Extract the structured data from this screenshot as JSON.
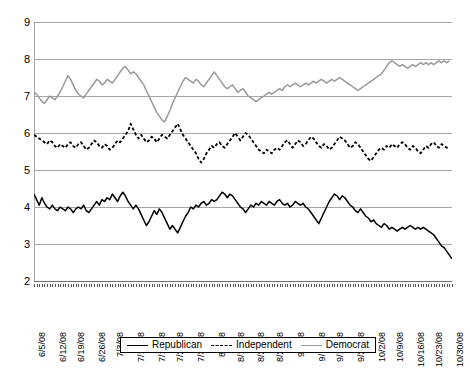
{
  "chart_data": {
    "type": "line",
    "title": "",
    "subtitle": "",
    "xlabel": "",
    "ylabel": "",
    "ylim": [
      2,
      9
    ],
    "yticks": [
      2,
      3,
      4,
      5,
      6,
      7,
      8,
      9
    ],
    "grid": true,
    "legend_position": "bottom",
    "x_tick_labels": [
      "6/5/08",
      "6/12/08",
      "6/19/08",
      "6/26/08",
      "7/3/08",
      "7/10/08",
      "7/17/08",
      "7/24/08",
      "7/31/08",
      "8/7/08",
      "8/14/08",
      "8/21/08",
      "8/28/08",
      "9/4/08",
      "9/11/08",
      "9/18/08",
      "9/25/08",
      "10/2/08",
      "10/9/08",
      "10/16/08",
      "10/23/08",
      "10/30/08"
    ],
    "x_range": [
      "6/5/08",
      "10/30/08"
    ],
    "series": [
      {
        "name": "Republican",
        "color": "#000000",
        "style": "solid",
        "values": [
          4.35,
          4.2,
          4.05,
          4.25,
          4.1,
          4.0,
          3.95,
          4.05,
          3.95,
          3.9,
          4.0,
          3.95,
          3.9,
          4.0,
          3.95,
          3.85,
          3.95,
          4.0,
          3.95,
          4.05,
          3.9,
          3.85,
          3.95,
          4.05,
          4.15,
          4.05,
          4.2,
          4.15,
          4.25,
          4.2,
          4.35,
          4.25,
          4.15,
          4.3,
          4.4,
          4.3,
          4.15,
          4.05,
          3.95,
          4.05,
          3.95,
          3.8,
          3.65,
          3.5,
          3.6,
          3.75,
          3.9,
          3.8,
          3.95,
          3.85,
          3.7,
          3.55,
          3.4,
          3.5,
          3.4,
          3.3,
          3.45,
          3.6,
          3.75,
          3.85,
          4.0,
          3.95,
          4.05,
          4.0,
          4.1,
          4.15,
          4.05,
          4.1,
          4.2,
          4.15,
          4.2,
          4.3,
          4.4,
          4.35,
          4.25,
          4.35,
          4.3,
          4.2,
          4.1,
          4.0,
          3.95,
          3.85,
          3.95,
          4.05,
          4.0,
          4.1,
          4.05,
          4.15,
          4.1,
          4.05,
          4.15,
          4.1,
          4.05,
          4.15,
          4.2,
          4.1,
          4.05,
          4.1,
          4.0,
          4.05,
          4.15,
          4.1,
          4.05,
          4.1,
          4.0,
          3.95,
          3.85,
          3.75,
          3.65,
          3.55,
          3.7,
          3.85,
          4.0,
          4.15,
          4.25,
          4.35,
          4.3,
          4.2,
          4.3,
          4.25,
          4.15,
          4.05,
          4.0,
          3.9,
          3.85,
          3.95,
          3.85,
          3.75,
          3.7,
          3.6,
          3.65,
          3.55,
          3.5,
          3.45,
          3.55,
          3.5,
          3.4,
          3.45,
          3.4,
          3.35,
          3.4,
          3.45,
          3.4,
          3.45,
          3.5,
          3.45,
          3.4,
          3.45,
          3.4,
          3.45,
          3.4,
          3.35,
          3.3,
          3.25,
          3.15,
          3.05,
          2.95,
          2.9,
          2.8,
          2.7,
          2.6
        ]
      },
      {
        "name": "Independent",
        "color": "#000000",
        "style": "dashed",
        "values": [
          5.95,
          5.9,
          5.85,
          5.8,
          5.75,
          5.7,
          5.8,
          5.75,
          5.65,
          5.6,
          5.7,
          5.65,
          5.6,
          5.7,
          5.75,
          5.65,
          5.6,
          5.7,
          5.75,
          5.65,
          5.55,
          5.6,
          5.7,
          5.8,
          5.75,
          5.65,
          5.6,
          5.7,
          5.65,
          5.55,
          5.6,
          5.7,
          5.8,
          5.75,
          5.85,
          5.95,
          6.05,
          6.25,
          6.1,
          5.95,
          5.85,
          5.95,
          5.85,
          5.75,
          5.8,
          5.9,
          5.85,
          5.75,
          5.85,
          5.95,
          5.9,
          5.85,
          5.95,
          6.05,
          6.15,
          6.25,
          6.1,
          5.95,
          5.85,
          5.75,
          5.65,
          5.55,
          5.45,
          5.3,
          5.2,
          5.3,
          5.45,
          5.55,
          5.65,
          5.6,
          5.7,
          5.75,
          5.65,
          5.6,
          5.7,
          5.8,
          5.9,
          6.0,
          5.9,
          5.8,
          5.9,
          6.0,
          5.95,
          5.85,
          5.75,
          5.65,
          5.55,
          5.5,
          5.45,
          5.55,
          5.5,
          5.45,
          5.55,
          5.6,
          5.55,
          5.65,
          5.75,
          5.8,
          5.7,
          5.6,
          5.7,
          5.8,
          5.75,
          5.65,
          5.7,
          5.8,
          5.9,
          5.85,
          5.75,
          5.65,
          5.6,
          5.7,
          5.65,
          5.55,
          5.6,
          5.7,
          5.8,
          5.9,
          5.85,
          5.8,
          5.7,
          5.6,
          5.65,
          5.75,
          5.7,
          5.6,
          5.5,
          5.4,
          5.3,
          5.25,
          5.35,
          5.45,
          5.55,
          5.6,
          5.55,
          5.65,
          5.6,
          5.7,
          5.65,
          5.6,
          5.7,
          5.75,
          5.7,
          5.6,
          5.55,
          5.65,
          5.6,
          5.5,
          5.45,
          5.55,
          5.65,
          5.6,
          5.7,
          5.75,
          5.65,
          5.6,
          5.7,
          5.65,
          5.6,
          5.65
        ]
      },
      {
        "name": "Democrat",
        "color": "#999999",
        "style": "solid",
        "values": [
          7.1,
          7.05,
          6.95,
          6.85,
          6.8,
          6.9,
          7.0,
          6.95,
          6.9,
          7.0,
          7.1,
          7.25,
          7.4,
          7.55,
          7.45,
          7.3,
          7.15,
          7.05,
          7.0,
          6.95,
          7.05,
          7.15,
          7.25,
          7.35,
          7.45,
          7.4,
          7.3,
          7.35,
          7.45,
          7.4,
          7.35,
          7.45,
          7.55,
          7.65,
          7.75,
          7.8,
          7.7,
          7.6,
          7.65,
          7.6,
          7.5,
          7.4,
          7.3,
          7.15,
          7.0,
          6.85,
          6.7,
          6.55,
          6.45,
          6.35,
          6.3,
          6.45,
          6.6,
          6.8,
          6.95,
          7.1,
          7.25,
          7.4,
          7.5,
          7.45,
          7.4,
          7.35,
          7.45,
          7.4,
          7.3,
          7.25,
          7.35,
          7.45,
          7.55,
          7.65,
          7.55,
          7.45,
          7.35,
          7.25,
          7.2,
          7.25,
          7.3,
          7.2,
          7.1,
          7.15,
          7.2,
          7.1,
          7.0,
          6.95,
          6.9,
          6.85,
          6.9,
          6.95,
          7.0,
          7.05,
          7.1,
          7.05,
          7.1,
          7.15,
          7.2,
          7.15,
          7.25,
          7.3,
          7.25,
          7.3,
          7.35,
          7.3,
          7.25,
          7.3,
          7.35,
          7.3,
          7.35,
          7.4,
          7.35,
          7.4,
          7.45,
          7.4,
          7.35,
          7.4,
          7.45,
          7.4,
          7.45,
          7.5,
          7.45,
          7.4,
          7.35,
          7.3,
          7.25,
          7.2,
          7.15,
          7.2,
          7.25,
          7.3,
          7.35,
          7.4,
          7.45,
          7.5,
          7.55,
          7.6,
          7.7,
          7.8,
          7.9,
          7.95,
          7.9,
          7.85,
          7.8,
          7.85,
          7.8,
          7.75,
          7.8,
          7.85,
          7.8,
          7.85,
          7.9,
          7.85,
          7.9,
          7.85,
          7.9,
          7.85,
          7.9,
          7.95,
          7.9,
          7.95,
          7.9,
          7.95
        ]
      }
    ]
  },
  "legend": {
    "items": [
      {
        "label": "Republican",
        "style": "solid",
        "color": "#000000"
      },
      {
        "label": "Independent",
        "style": "dashed",
        "color": "#000000"
      },
      {
        "label": "Democrat",
        "style": "solid",
        "color": "#999999"
      }
    ]
  },
  "colors": {
    "republican": "#000000",
    "independent": "#000000",
    "democrat": "#999999",
    "gridline": "#a6a6a6",
    "axis": "#6f6f6f",
    "background": "#ffffff"
  }
}
